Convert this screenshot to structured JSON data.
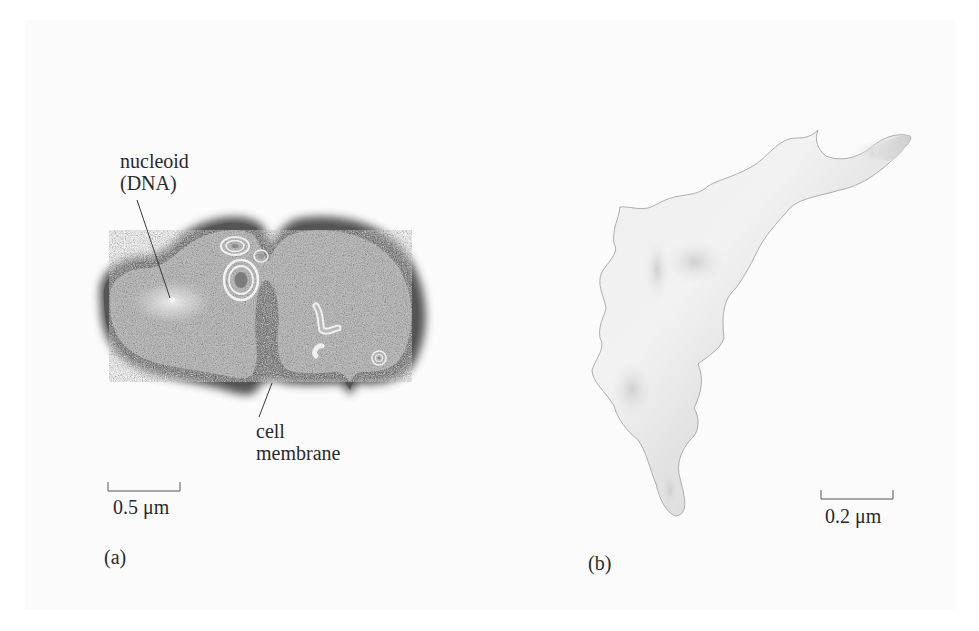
{
  "figure": {
    "panel_a": {
      "id_label": "(a)",
      "title": "Bacterial cell cross-section",
      "annotations": [
        {
          "name": "nucleoid",
          "line1": "nucleoid",
          "line2": "(DNA)"
        },
        {
          "name": "cell-membrane",
          "line1": "cell",
          "line2": "membrane"
        }
      ],
      "scale_bar": {
        "label": "0.5 μm"
      }
    },
    "panel_b": {
      "id_label": "(b)",
      "title": "Irregular cell shape",
      "scale_bar": {
        "label": "0.2 μm"
      }
    },
    "colors": {
      "background": "#ffffff",
      "panel": "#fbfbfb",
      "cell_fill": "#c9c9c9",
      "membrane": "#4a4a4a",
      "shape_b_fill": "#e8e8e8",
      "shape_b_dark": "#c4c4c4",
      "text": "#2a2a2a"
    }
  }
}
